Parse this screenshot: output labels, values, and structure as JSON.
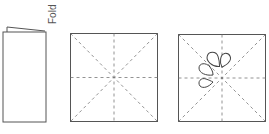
{
  "diagram": {
    "fold_label": "Fold",
    "steps": [
      {
        "id": "folded-card",
        "description": "Folded card"
      },
      {
        "id": "creased-square",
        "description": "Square with fold guide lines"
      },
      {
        "id": "petal-square",
        "description": "Square with fold lines and four petal shapes"
      }
    ],
    "colors": {
      "line": "#555555",
      "dash": "#777777",
      "background": "#ffffff"
    }
  }
}
